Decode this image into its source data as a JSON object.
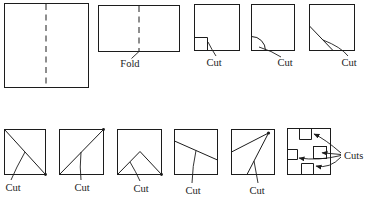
{
  "colors": {
    "line": "#1c1c1c",
    "background": "#ffffff"
  },
  "figures": {
    "folded_rect": {
      "caption": "Fold"
    },
    "corner_notch_cut": {
      "caption": "Cut"
    },
    "corner_arc_cut": {
      "caption": "Cut"
    },
    "diagonal_corner_cut": {
      "caption": "Cut"
    },
    "diagonal_tlbr_cut": {
      "caption": "Cut"
    },
    "diagonal_bltr_cut": {
      "caption": "Cut"
    },
    "tent_cut": {
      "caption": "Cut"
    },
    "slant_cut": {
      "caption": "Cut"
    },
    "spike_cut": {
      "caption": "Cut"
    },
    "multi_notch_cuts": {
      "caption": "Cuts"
    }
  }
}
